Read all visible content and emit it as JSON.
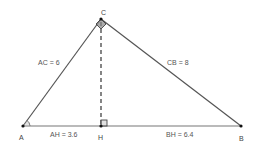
{
  "diagram": {
    "colors": {
      "stroke": "#555555",
      "dashed": "#444444",
      "point": "#111111",
      "angle_mark": "#666666",
      "text": "#555555",
      "background": "#ffffff"
    },
    "vertices": {
      "A": {
        "label": "A",
        "x": 23,
        "y": 126
      },
      "B": {
        "label": "B",
        "x": 241,
        "y": 126
      },
      "C": {
        "label": "C",
        "x": 101,
        "y": 19
      },
      "H": {
        "label": "H",
        "x": 101,
        "y": 126
      }
    },
    "segments": {
      "AC": {
        "label": "AC = 6"
      },
      "CB": {
        "label": "CB = 8"
      },
      "AH": {
        "label": "AH = 3.6"
      },
      "BH": {
        "label": "BH = 6.4"
      }
    },
    "altitude": {
      "from": "C",
      "to": "H",
      "style": "dashed"
    },
    "marks": {
      "right_angle_at_H": true,
      "right_angle_at_C": true,
      "angle_at_A": true
    }
  }
}
